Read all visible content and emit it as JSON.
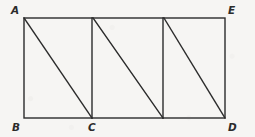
{
  "figure": {
    "background_color": "#f6f5f3",
    "stroke_color": "#2b2b2b",
    "label_color": "#2b2b2b",
    "stroke_width": 1.4,
    "viewbox": "0 0 255 137",
    "rectangle": {
      "name": "outer-rectangle",
      "x": 24,
      "y": 18,
      "width": 201,
      "height": 100,
      "corners": {
        "top_left": [
          24,
          18
        ],
        "top_right": [
          225,
          18
        ],
        "bottom_right": [
          225,
          118
        ],
        "bottom_left": [
          24,
          118
        ]
      }
    },
    "vertical_segments": [
      {
        "name": "vertical-at-c",
        "x1": 92,
        "y1": 18,
        "x2": 92,
        "y2": 118
      },
      {
        "name": "vertical-middle-right",
        "x1": 163,
        "y1": 18,
        "x2": 163,
        "y2": 118
      }
    ],
    "diagonal_segments": [
      {
        "name": "diagonal-a-to-c",
        "x1": 24,
        "y1": 18,
        "x2": 92,
        "y2": 118
      },
      {
        "name": "diagonal-two",
        "x1": 93,
        "y1": 18,
        "x2": 163,
        "y2": 118
      },
      {
        "name": "diagonal-three-to-d",
        "x1": 164,
        "y1": 18,
        "x2": 225,
        "y2": 118
      }
    ],
    "labels": [
      {
        "id": "A",
        "text": "A",
        "x": 11,
        "y": 5,
        "anchor": "top-left-outside"
      },
      {
        "id": "E",
        "text": "E",
        "x": 228,
        "y": 5,
        "anchor": "top-right-outside"
      },
      {
        "id": "B",
        "text": "B",
        "x": 12,
        "y": 122,
        "anchor": "bottom-left-outside"
      },
      {
        "id": "C",
        "text": "C",
        "x": 88,
        "y": 122,
        "anchor": "bottom-center"
      },
      {
        "id": "D",
        "text": "D",
        "x": 228,
        "y": 122,
        "anchor": "bottom-right-outside"
      }
    ]
  }
}
